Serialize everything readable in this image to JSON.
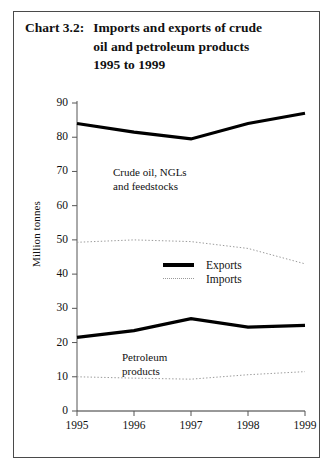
{
  "title": {
    "number": "Chart 3.2:",
    "lines": [
      "Imports and exports of crude",
      "oil and petroleum products",
      "1995 to 1999"
    ]
  },
  "annotations": {
    "crude": [
      "Crude oil, NGLs",
      "and feedstocks"
    ],
    "petroleum": [
      "Petroleum",
      "products"
    ]
  },
  "legend": {
    "position": "inside-center",
    "items": [
      {
        "label": "Exports",
        "marker": "thick-solid-black",
        "color": "#000000"
      },
      {
        "label": "Imports",
        "marker": "thin-dotted-grey",
        "color": "#9a9a9a"
      }
    ]
  },
  "chart_data": {
    "type": "line",
    "title": "Chart 3.2: Imports and exports of crude oil and petroleum products 1995 to 1999",
    "xlabel": "",
    "ylabel": "Million tonnes",
    "x": [
      "1995",
      "1996",
      "1997",
      "1998",
      "1999"
    ],
    "xtick_labels": [
      "1995",
      "1996",
      "1997",
      "1998",
      "1999"
    ],
    "ytick_labels": [
      "0",
      "10",
      "20",
      "30",
      "40",
      "50",
      "60",
      "70",
      "80",
      "90"
    ],
    "ylim": [
      0,
      90
    ],
    "ytick_step": 10,
    "grid": false,
    "series": [
      {
        "name": "Crude oil, NGLs and feedstocks - Exports",
        "group": "Crude oil, NGLs and feedstocks",
        "flow": "Exports",
        "style": "thick-solid-black",
        "color": "#000000",
        "values": [
          84.0,
          81.5,
          79.5,
          84.0,
          87.0
        ]
      },
      {
        "name": "Crude oil, NGLs and feedstocks - Imports",
        "group": "Crude oil, NGLs and feedstocks",
        "flow": "Imports",
        "style": "thin-dotted-grey",
        "color": "#9a9a9a",
        "values": [
          49.3,
          50.0,
          49.5,
          47.5,
          43.0
        ]
      },
      {
        "name": "Petroleum products - Exports",
        "group": "Petroleum products",
        "flow": "Exports",
        "style": "thick-solid-black",
        "color": "#000000",
        "values": [
          21.5,
          23.5,
          27.0,
          24.5,
          25.0
        ]
      },
      {
        "name": "Petroleum products - Imports",
        "group": "Petroleum products",
        "flow": "Imports",
        "style": "thin-dotted-grey",
        "color": "#9a9a9a",
        "values": [
          10.0,
          9.6,
          9.3,
          10.6,
          11.5
        ]
      }
    ]
  }
}
